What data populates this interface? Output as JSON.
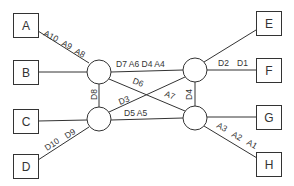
{
  "terminals": [
    {
      "id": "A",
      "label": "A",
      "x": 13,
      "y": 13
    },
    {
      "id": "B",
      "label": "B",
      "x": 13,
      "y": 60
    },
    {
      "id": "C",
      "label": "C",
      "x": 13,
      "y": 109
    },
    {
      "id": "D",
      "label": "D",
      "x": 13,
      "y": 154
    },
    {
      "id": "E",
      "label": "E",
      "x": 256,
      "y": 11
    },
    {
      "id": "F",
      "label": "F",
      "x": 256,
      "y": 58
    },
    {
      "id": "G",
      "label": "G",
      "x": 256,
      "y": 105
    },
    {
      "id": "H",
      "label": "H",
      "x": 256,
      "y": 152
    }
  ],
  "switches": [
    {
      "id": "top-left",
      "cx": 99,
      "cy": 72
    },
    {
      "id": "top-right",
      "cx": 195,
      "cy": 70
    },
    {
      "id": "bottom-left",
      "cx": 99,
      "cy": 119
    },
    {
      "id": "bottom-right",
      "cx": 195,
      "cy": 118
    }
  ],
  "edge_labels": {
    "a10": "A10",
    "a9": "A9",
    "a8": "A8",
    "top_link": "D7  A6  D4  A4",
    "d2": "D2",
    "d1": "D1",
    "d6": "D6",
    "a7": "A7",
    "d3": "D3",
    "d8": "D8",
    "d4": "D4",
    "bottom_link": "D5  A5",
    "d10": "D10",
    "d9": "D9",
    "a3": "A3",
    "a2": "A2",
    "a1": "A1"
  }
}
